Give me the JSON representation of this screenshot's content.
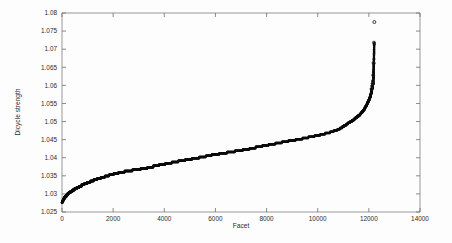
{
  "chart_data": {
    "type": "scatter",
    "title": "",
    "xlabel": "Facet",
    "ylabel": "Dicycle strength",
    "xlim": [
      0,
      14000
    ],
    "ylim": [
      1.025,
      1.08
    ],
    "xticks": [
      0,
      2000,
      4000,
      6000,
      8000,
      10000,
      12000,
      14000
    ],
    "xtick_labels": [
      "0",
      "2000",
      "4000",
      "6000",
      "8000",
      "10000",
      "12000",
      "14000"
    ],
    "yticks": [
      1.025,
      1.03,
      1.035,
      1.04,
      1.045,
      1.05,
      1.055,
      1.06,
      1.065,
      1.07,
      1.075,
      1.08
    ],
    "ytick_labels": [
      "1.025",
      "1.03",
      "1.035",
      "1.04",
      "1.045",
      "1.05",
      "1.055",
      "1.06",
      "1.065",
      "1.07",
      "1.075",
      "1.08"
    ],
    "grid": false,
    "legend": null,
    "marker": "circle",
    "marker_color": "#0b0b0b",
    "series": [
      {
        "name": "dicycle strength",
        "x": [
          0,
          40,
          80,
          120,
          170,
          220,
          280,
          340,
          400,
          470,
          540,
          620,
          700,
          790,
          880,
          980,
          1080,
          1190,
          1300,
          1420,
          1550,
          1690,
          1830,
          1980,
          2140,
          2300,
          2470,
          2640,
          2820,
          3000,
          3190,
          3380,
          3580,
          3780,
          3990,
          4200,
          4420,
          4640,
          4870,
          5100,
          5340,
          5580,
          5830,
          6080,
          6340,
          6600,
          6870,
          7140,
          7420,
          7700,
          7990,
          8280,
          8580,
          8880,
          9190,
          9500,
          9820,
          10140,
          10470,
          10800,
          11000,
          11150,
          11300,
          11420,
          11530,
          11630,
          11720,
          11800,
          11870,
          11930,
          11980,
          12020,
          12060,
          12090,
          12110,
          12130,
          12150,
          12165,
          12180,
          12195,
          12210
        ],
        "y": [
          1.0276,
          1.0282,
          1.0287,
          1.0291,
          1.0295,
          1.0299,
          1.0303,
          1.0306,
          1.0309,
          1.0312,
          1.0315,
          1.0318,
          1.0321,
          1.0324,
          1.0327,
          1.033,
          1.0333,
          1.0336,
          1.0339,
          1.0342,
          1.0345,
          1.0348,
          1.0351,
          1.0354,
          1.0357,
          1.036,
          1.0362,
          1.0364,
          1.0366,
          1.0368,
          1.037,
          1.0373,
          1.0376,
          1.0379,
          1.0382,
          1.0385,
          1.0388,
          1.0391,
          1.0394,
          1.0397,
          1.04,
          1.0403,
          1.0407,
          1.041,
          1.0413,
          1.0416,
          1.0419,
          1.0422,
          1.0426,
          1.043,
          1.0434,
          1.0438,
          1.0442,
          1.0446,
          1.045,
          1.0454,
          1.0459,
          1.0464,
          1.047,
          1.0478,
          1.0486,
          1.0493,
          1.05,
          1.0506,
          1.0512,
          1.0518,
          1.0525,
          1.0532,
          1.054,
          1.0548,
          1.0556,
          1.0562,
          1.057,
          1.0578,
          1.0586,
          1.0592,
          1.0598,
          1.0605,
          1.0628,
          1.0662,
          1.0718
        ],
        "outliers_x": [
          12105,
          12130,
          12150,
          12160,
          12170,
          12185,
          12200,
          12215
        ],
        "outliers_y": [
          1.059,
          1.0598,
          1.0605,
          1.0612,
          1.0628,
          1.0662,
          1.0718,
          1.0775
        ]
      }
    ]
  },
  "axes": {
    "x_title": "Facet",
    "y_title": "Dicycle strength"
  }
}
